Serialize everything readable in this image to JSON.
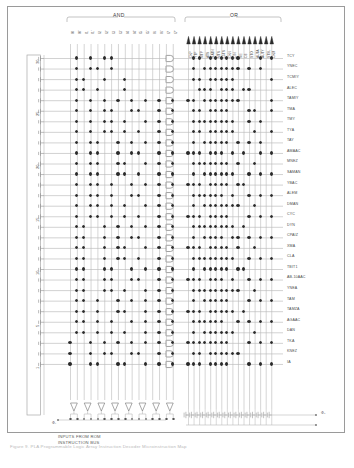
{
  "figure": {
    "title": "PLA Programmable Logic Array instruction decoder",
    "caption": "Figure 9. PLA Programmable Logic Array Instruction Decoder Microinstruction Map",
    "bus_note_line1": "INPUTS FROM ROM",
    "bus_note_line2": "INSTRUCTION BUS"
  },
  "sections": {
    "and_label": "AND",
    "or_label": "OR"
  },
  "and_inputs": [
    {
      "name": "I0",
      "label": "I0"
    },
    {
      "name": "I1",
      "label": "I1"
    },
    {
      "name": "I2",
      "label": "I2"
    },
    {
      "name": "I3",
      "label": "I3"
    },
    {
      "name": "I4",
      "label": "I4"
    },
    {
      "name": "I5",
      "label": "I5"
    },
    {
      "name": "I6",
      "label": "I6"
    },
    {
      "name": "I7",
      "label": "I7"
    }
  ],
  "or_outputs": [
    "CKP",
    "YTP",
    "MTP",
    "ATN",
    "NATN",
    "MTN",
    "15TN",
    "CKN",
    "CIN",
    "NE",
    "C8",
    "STO",
    "AUTA",
    "AUTY",
    "STSL",
    "CKM"
  ],
  "row_markers": [
    "30",
    "25",
    "20",
    "15",
    "10",
    "5",
    "1"
  ],
  "microinstructions": [
    "TCY",
    "YNEC",
    "TCMIY",
    "ALEC",
    "TAMIY",
    "TMA",
    "TMY",
    "TYA",
    "TAY",
    "AMAAC",
    "MNEZ",
    "SAMAN",
    "YBAC",
    "ALEM",
    "DMAN",
    "CYC",
    "DYN",
    "CPAIZ",
    "XMA",
    "CLA",
    "TBIT1",
    "AB-10AAC",
    "YNEA",
    "TAM",
    "TAMZA",
    "AGAAC",
    "DAN",
    "TKA",
    "KNEZ",
    "IA"
  ],
  "output_terminals": [
    {
      "name": "phi1-terminal",
      "label": "Φ₁"
    },
    {
      "name": "phi2-terminal",
      "label": "Φ₂"
    }
  ],
  "colors": {
    "line": "#b9b9b9",
    "dot": "#2a2a2a",
    "text": "#4a4a4a",
    "frame": "#9a9a9a"
  },
  "chart_data": {
    "type": "heatmap",
    "title": "PLA Programmable Logic Array Instruction Decoder Microinstruction Map",
    "xlabel": "AND plane product-term inputs / OR plane microinstruction outputs",
    "ylabel": "Instruction row",
    "grid": true,
    "legend": "none",
    "and_columns": 16,
    "or_columns": 16,
    "rows": 30,
    "and_column_labels": [
      "I0",
      "I0'",
      "I1",
      "I1'",
      "I2",
      "I2'",
      "I3",
      "I3'",
      "I4",
      "I4'",
      "I5",
      "I5'",
      "I6",
      "I6'",
      "I7",
      "I7'"
    ],
    "or_column_labels": [
      "CKP",
      "YTP",
      "MTP",
      "ATN",
      "NATN",
      "MTN",
      "15TN",
      "CKN",
      "CIN",
      "NE",
      "C8",
      "STO",
      "AUTA",
      "AUTY",
      "STSL",
      "CKM"
    ],
    "row_labels": [
      "TCY",
      "YNEC",
      "TCMIY",
      "ALEC",
      "TAMIY",
      "TMA",
      "TMY",
      "TYA",
      "TAY",
      "AMAAC",
      "MNEZ",
      "SAMAN",
      "YBAC",
      "ALEM",
      "DMAN",
      "CYC",
      "DYN",
      "CPAIZ",
      "XMA",
      "CLA",
      "TBIT1",
      "AB-10AAC",
      "YNEA",
      "TAM",
      "TAMZA",
      "AGAAC",
      "DAN",
      "TKA",
      "KNEZ",
      "IA"
    ],
    "and_matrix": [
      [
        0,
        1,
        0,
        1,
        0,
        1,
        1,
        0,
        0,
        0,
        0,
        0,
        0,
        0,
        0,
        0
      ],
      [
        0,
        1,
        0,
        1,
        1,
        0,
        1,
        0,
        0,
        0,
        0,
        0,
        0,
        0,
        0,
        0
      ],
      [
        0,
        1,
        1,
        0,
        0,
        1,
        0,
        0,
        1,
        0,
        0,
        0,
        0,
        0,
        0,
        0
      ],
      [
        0,
        1,
        1,
        0,
        1,
        0,
        0,
        0,
        1,
        0,
        0,
        0,
        0,
        0,
        0,
        0
      ],
      [
        0,
        1,
        0,
        1,
        0,
        1,
        0,
        1,
        0,
        1,
        0,
        1,
        0,
        1,
        0,
        1
      ],
      [
        0,
        1,
        0,
        1,
        0,
        1,
        1,
        0,
        0,
        1,
        1,
        0,
        0,
        1,
        0,
        1
      ],
      [
        0,
        1,
        0,
        1,
        0,
        1,
        1,
        0,
        1,
        0,
        0,
        1,
        0,
        1,
        0,
        1
      ],
      [
        0,
        1,
        0,
        1,
        0,
        1,
        1,
        0,
        1,
        0,
        1,
        0,
        0,
        1,
        0,
        1
      ],
      [
        0,
        1,
        0,
        1,
        1,
        0,
        0,
        1,
        0,
        1,
        0,
        1,
        0,
        1,
        0,
        1
      ],
      [
        0,
        1,
        0,
        1,
        1,
        0,
        0,
        1,
        0,
        1,
        1,
        0,
        0,
        1,
        0,
        1
      ],
      [
        0,
        1,
        0,
        1,
        1,
        0,
        0,
        1,
        1,
        0,
        0,
        1,
        0,
        1,
        0,
        1
      ],
      [
        0,
        1,
        0,
        1,
        1,
        0,
        0,
        1,
        1,
        0,
        1,
        0,
        0,
        1,
        0,
        1
      ],
      [
        0,
        1,
        0,
        1,
        1,
        0,
        1,
        0,
        0,
        1,
        0,
        1,
        0,
        1,
        0,
        1
      ],
      [
        0,
        1,
        0,
        1,
        1,
        0,
        1,
        0,
        0,
        1,
        1,
        0,
        0,
        1,
        0,
        1
      ],
      [
        0,
        1,
        0,
        1,
        1,
        0,
        1,
        0,
        1,
        0,
        0,
        1,
        0,
        1,
        0,
        1
      ],
      [
        0,
        1,
        0,
        1,
        1,
        0,
        1,
        0,
        1,
        0,
        1,
        0,
        0,
        1,
        0,
        1
      ],
      [
        0,
        1,
        1,
        0,
        0,
        1,
        0,
        1,
        0,
        1,
        0,
        1,
        0,
        1,
        0,
        1
      ],
      [
        0,
        1,
        1,
        0,
        0,
        1,
        0,
        1,
        0,
        1,
        1,
        0,
        0,
        1,
        0,
        1
      ],
      [
        0,
        1,
        1,
        0,
        0,
        1,
        0,
        1,
        1,
        0,
        0,
        1,
        0,
        1,
        0,
        1
      ],
      [
        0,
        1,
        1,
        0,
        0,
        1,
        0,
        1,
        1,
        0,
        1,
        0,
        0,
        1,
        0,
        1
      ],
      [
        0,
        1,
        1,
        0,
        0,
        1,
        1,
        0,
        0,
        1,
        0,
        1,
        0,
        1,
        0,
        1
      ],
      [
        0,
        1,
        1,
        0,
        0,
        1,
        1,
        0,
        0,
        1,
        1,
        0,
        0,
        1,
        0,
        1
      ],
      [
        0,
        1,
        1,
        0,
        0,
        1,
        1,
        0,
        1,
        0,
        0,
        1,
        0,
        1,
        0,
        1
      ],
      [
        0,
        1,
        1,
        0,
        1,
        0,
        0,
        1,
        0,
        1,
        0,
        1,
        0,
        1,
        0,
        1
      ],
      [
        0,
        1,
        1,
        0,
        1,
        0,
        0,
        1,
        1,
        0,
        0,
        1,
        0,
        1,
        0,
        1
      ],
      [
        0,
        1,
        1,
        0,
        1,
        0,
        1,
        0,
        0,
        1,
        0,
        1,
        0,
        1,
        0,
        1
      ],
      [
        0,
        1,
        1,
        0,
        1,
        0,
        1,
        0,
        1,
        0,
        0,
        1,
        0,
        1,
        0,
        1
      ],
      [
        1,
        0,
        0,
        1,
        0,
        1,
        0,
        1,
        0,
        1,
        0,
        1,
        0,
        1,
        0,
        1
      ],
      [
        1,
        0,
        0,
        1,
        0,
        1,
        1,
        0,
        0,
        1,
        1,
        0,
        0,
        1,
        0,
        1
      ],
      [
        1,
        0,
        0,
        1,
        1,
        0,
        0,
        1,
        1,
        0,
        0,
        1,
        0,
        1,
        0,
        1
      ]
    ],
    "or_matrix": [
      [
        0,
        1,
        1,
        0,
        1,
        1,
        1,
        1,
        1,
        1,
        0,
        0,
        0,
        1,
        0,
        1
      ],
      [
        0,
        1,
        0,
        1,
        1,
        1,
        1,
        1,
        1,
        1,
        0,
        1,
        0,
        1,
        0,
        0
      ],
      [
        0,
        1,
        1,
        0,
        1,
        1,
        1,
        1,
        1,
        0,
        0,
        0,
        0,
        0,
        0,
        1
      ],
      [
        0,
        0,
        1,
        1,
        1,
        0,
        1,
        1,
        1,
        0,
        1,
        1,
        0,
        0,
        0,
        0
      ],
      [
        1,
        1,
        0,
        1,
        1,
        1,
        1,
        1,
        1,
        1,
        0,
        0,
        0,
        0,
        0,
        1
      ],
      [
        0,
        1,
        1,
        0,
        1,
        1,
        1,
        1,
        0,
        0,
        0,
        1,
        1,
        0,
        0,
        1
      ],
      [
        0,
        1,
        1,
        1,
        1,
        1,
        1,
        1,
        1,
        0,
        0,
        1,
        0,
        1,
        0,
        0
      ],
      [
        0,
        1,
        1,
        0,
        1,
        1,
        1,
        1,
        1,
        0,
        0,
        0,
        1,
        0,
        0,
        1
      ],
      [
        0,
        1,
        0,
        1,
        1,
        1,
        1,
        1,
        0,
        1,
        0,
        1,
        0,
        1,
        0,
        0
      ],
      [
        1,
        1,
        1,
        0,
        1,
        1,
        1,
        0,
        1,
        0,
        1,
        0,
        0,
        1,
        0,
        1
      ],
      [
        0,
        1,
        1,
        1,
        1,
        1,
        1,
        1,
        0,
        1,
        0,
        0,
        1,
        0,
        0,
        0
      ],
      [
        0,
        1,
        0,
        1,
        1,
        1,
        1,
        1,
        1,
        0,
        0,
        1,
        0,
        1,
        0,
        1
      ],
      [
        1,
        1,
        1,
        0,
        1,
        1,
        1,
        1,
        0,
        1,
        1,
        0,
        0,
        0,
        0,
        0
      ],
      [
        0,
        1,
        1,
        1,
        1,
        1,
        1,
        0,
        1,
        0,
        0,
        1,
        0,
        1,
        0,
        1
      ],
      [
        0,
        1,
        0,
        1,
        1,
        1,
        1,
        1,
        1,
        1,
        0,
        0,
        1,
        0,
        0,
        0
      ],
      [
        1,
        1,
        1,
        0,
        1,
        1,
        1,
        1,
        0,
        0,
        0,
        1,
        0,
        1,
        0,
        1
      ],
      [
        0,
        1,
        1,
        1,
        1,
        1,
        1,
        1,
        1,
        0,
        1,
        0,
        0,
        0,
        0,
        0
      ],
      [
        0,
        1,
        0,
        1,
        1,
        1,
        1,
        0,
        1,
        1,
        0,
        1,
        0,
        1,
        0,
        1
      ],
      [
        1,
        1,
        1,
        0,
        1,
        1,
        1,
        1,
        0,
        1,
        0,
        0,
        1,
        0,
        0,
        0
      ],
      [
        0,
        1,
        1,
        1,
        1,
        1,
        1,
        1,
        1,
        0,
        0,
        1,
        0,
        1,
        0,
        1
      ],
      [
        0,
        1,
        0,
        1,
        1,
        1,
        1,
        1,
        0,
        1,
        1,
        0,
        0,
        0,
        0,
        0
      ],
      [
        1,
        1,
        1,
        0,
        1,
        1,
        1,
        0,
        1,
        0,
        0,
        1,
        0,
        1,
        0,
        1
      ],
      [
        0,
        1,
        1,
        1,
        1,
        1,
        1,
        1,
        1,
        1,
        0,
        0,
        1,
        0,
        0,
        0
      ],
      [
        0,
        1,
        0,
        1,
        1,
        1,
        1,
        1,
        0,
        0,
        0,
        1,
        0,
        1,
        0,
        1
      ],
      [
        1,
        1,
        1,
        0,
        1,
        1,
        1,
        1,
        1,
        0,
        1,
        0,
        0,
        0,
        0,
        0
      ],
      [
        0,
        1,
        1,
        1,
        1,
        1,
        1,
        0,
        0,
        1,
        0,
        1,
        0,
        1,
        0,
        1
      ],
      [
        0,
        1,
        0,
        1,
        1,
        1,
        1,
        1,
        1,
        0,
        0,
        0,
        1,
        0,
        0,
        0
      ],
      [
        1,
        1,
        1,
        1,
        1,
        1,
        1,
        1,
        0,
        0,
        0,
        1,
        0,
        1,
        0,
        1
      ],
      [
        0,
        1,
        1,
        0,
        1,
        1,
        1,
        1,
        1,
        1,
        0,
        0,
        0,
        0,
        0,
        0
      ],
      [
        1,
        1,
        1,
        0,
        1,
        1,
        1,
        1,
        0,
        0,
        0,
        1,
        0,
        1,
        0,
        1
      ]
    ]
  }
}
